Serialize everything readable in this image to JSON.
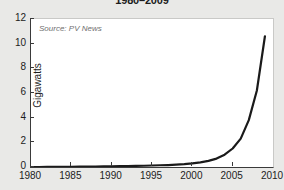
{
  "chart_data": {
    "type": "line",
    "title": "1980–2009",
    "xlabel": "",
    "ylabel": "Gigawatts",
    "xlim": [
      1980,
      2010
    ],
    "ylim": [
      0,
      12
    ],
    "grid": false,
    "legend": "none",
    "annotation": "Source: PV News",
    "xticks": [
      1980,
      1985,
      1990,
      1995,
      2000,
      2005,
      2010
    ],
    "xtick_labels": [
      "1980",
      "1985",
      "1990",
      "1995",
      "2000",
      "2005",
      "2010"
    ],
    "yticks": [
      0,
      2,
      4,
      6,
      8,
      10,
      12
    ],
    "ytick_labels": [
      "0",
      "2",
      "4",
      "6",
      "8",
      "10",
      "12"
    ],
    "series": [
      {
        "name": "Cumulative solar PV installations",
        "color": "#1a1a1a",
        "x": [
          1980,
          1981,
          1982,
          1983,
          1984,
          1985,
          1986,
          1987,
          1988,
          1989,
          1990,
          1991,
          1992,
          1993,
          1994,
          1995,
          1996,
          1997,
          1998,
          1999,
          2000,
          2001,
          2002,
          2003,
          2004,
          2005,
          2006,
          2007,
          2008,
          2009
        ],
        "values": [
          0.0,
          0.0,
          0.01,
          0.01,
          0.02,
          0.02,
          0.03,
          0.03,
          0.04,
          0.05,
          0.06,
          0.07,
          0.08,
          0.09,
          0.1,
          0.12,
          0.14,
          0.16,
          0.19,
          0.23,
          0.29,
          0.38,
          0.5,
          0.68,
          1.0,
          1.5,
          2.3,
          3.8,
          6.2,
          10.6
        ]
      }
    ]
  }
}
